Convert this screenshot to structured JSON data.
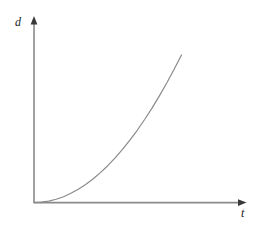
{
  "figure": {
    "title": "",
    "background_color": "#ffffff",
    "width": 268,
    "height": 225
  },
  "axes": {
    "y_axis": {
      "label": "d",
      "name": "distance",
      "arrow": "up",
      "color": "#8a8a8a"
    },
    "x_axis": {
      "label": "t",
      "name": "time",
      "arrow": "right",
      "color": "#8a8a8a"
    },
    "origin_label": ""
  },
  "chart_data": {
    "type": "line",
    "title": "",
    "xlabel": "t",
    "ylabel": "d",
    "grid": false,
    "legend": null,
    "xlim": [
      0,
      1
    ],
    "ylim": [
      0,
      1
    ],
    "axis_ticks": {
      "x": [],
      "y": []
    },
    "annotations": [],
    "series": [
      {
        "name": "d(t)",
        "description": "Smooth increasing concave-up curve starting at the origin tangent to the t-axis, rising steeply toward the upper right; consistent with d proportional to t squared.",
        "color": "#8a8a8a",
        "line_width": 1.2,
        "x": [
          0.0,
          0.05,
          0.1,
          0.15,
          0.2,
          0.25,
          0.3,
          0.35,
          0.4,
          0.45,
          0.5,
          0.55,
          0.6,
          0.65,
          0.7,
          0.75,
          0.8,
          0.85,
          0.9,
          0.95,
          1.0
        ],
        "y": [
          0.0,
          0.003,
          0.01,
          0.023,
          0.04,
          0.063,
          0.09,
          0.123,
          0.16,
          0.203,
          0.25,
          0.303,
          0.36,
          0.423,
          0.49,
          0.563,
          0.64,
          0.723,
          0.81,
          0.903,
          1.0
        ]
      }
    ]
  },
  "colors": {
    "stroke": "#8a8a8a",
    "text": "#1a1a1a",
    "background": "#ffffff"
  }
}
